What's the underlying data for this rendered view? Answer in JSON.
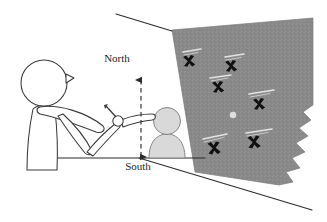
{
  "figure": {
    "direction_labels": {
      "north": "North",
      "south": "South"
    },
    "colors": {
      "poster_fill": "#8a8a8a",
      "poster_edge": "#777777",
      "seated_figure_fill": "#d9d9d9",
      "seated_figure_stroke": "#6e6e6e",
      "standing_figure_stroke": "#3a3a3a",
      "line_stroke": "#2b2b2b",
      "marker_fill": "#101010",
      "annotation_text": "#1d1d1d",
      "background": "#ffffff",
      "poster_label_ink": "#f0f0f0"
    },
    "standing_figure": {
      "name": "standing-person-outline",
      "description": "Outlined profile of a standing person with extended pointing arm"
    },
    "seated_figure": {
      "name": "seated-person-silhouette",
      "description": "Small grey filled bust silhouette in front of the wall map"
    },
    "pointing_hand": {
      "name": "pointing-hand",
      "description": "Hand with index finger extended toward the wall"
    },
    "axis_arrow": {
      "name": "north-south-axis",
      "style": "dashed double-headed vertical arrow",
      "top_label": "North",
      "bottom_label": "South"
    },
    "ground_line": {
      "name": "ground-line",
      "description": "Horizontal floor reference line"
    },
    "perspective_lines": [
      {
        "name": "upper-perspective-line"
      },
      {
        "name": "lower-perspective-line"
      }
    ],
    "poster": {
      "name": "wall-map-poster",
      "description": "Grey wall map shown in perspective with a torn right edge",
      "marker_glyph": "✖",
      "markers": [
        {
          "id": "marker-1",
          "x": 189,
          "y": 61,
          "size": 9,
          "label_visible": false,
          "label_text": ""
        },
        {
          "id": "marker-2",
          "x": 231,
          "y": 66,
          "size": 9,
          "label_visible": false,
          "label_text": ""
        },
        {
          "id": "marker-3",
          "x": 218,
          "y": 87,
          "size": 9,
          "label_visible": false,
          "label_text": ""
        },
        {
          "id": "marker-4",
          "x": 259,
          "y": 104,
          "size": 9,
          "label_visible": false,
          "label_text": ""
        },
        {
          "id": "marker-5",
          "x": 214,
          "y": 148,
          "size": 10,
          "label_visible": false,
          "label_text": ""
        },
        {
          "id": "marker-6",
          "x": 254,
          "y": 142,
          "size": 10,
          "label_visible": false,
          "label_text": ""
        }
      ],
      "marker_count": 6,
      "white_dot": {
        "id": "map-dot",
        "x": 233,
        "y": 115,
        "r": 3
      },
      "caption_strokes": 6
    }
  }
}
